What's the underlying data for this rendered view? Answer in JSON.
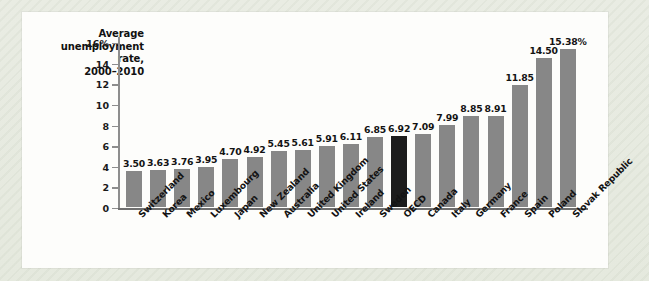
{
  "chart_data": {
    "type": "bar",
    "title": "Average unemployment rate, 2000–2010",
    "title_lines": [
      "Average",
      "unemployment",
      "rate,",
      "2000–2010"
    ],
    "xlabel": "",
    "ylabel": "",
    "ylim": [
      0,
      16
    ],
    "grid": false,
    "legend": null,
    "y_ticks": [
      "0",
      "2",
      "4",
      "6",
      "8",
      "10",
      "12",
      "14",
      "16%"
    ],
    "y_tick_values": [
      0,
      2,
      4,
      6,
      8,
      10,
      12,
      14,
      16
    ],
    "value_suffix_last": "%",
    "highlight_category": "OECD",
    "categories": [
      "Switzerland",
      "Korea",
      "Mexico",
      "Luxembourg",
      "Japan",
      "New Zealand",
      "Australia",
      "United Kingdom",
      "United States",
      "Ireland",
      "Sweden",
      "OECD",
      "Canada",
      "Italy",
      "Germany",
      "France",
      "Spain",
      "Poland",
      "Slovak Republic"
    ],
    "values": [
      3.5,
      3.63,
      3.76,
      3.95,
      4.7,
      4.92,
      5.45,
      5.61,
      5.91,
      6.11,
      6.85,
      6.92,
      7.09,
      7.99,
      8.85,
      8.91,
      11.85,
      14.5,
      15.38
    ],
    "value_labels": [
      "3.50",
      "3.63",
      "3.76",
      "3.95",
      "4.70",
      "4.92",
      "5.45",
      "5.61",
      "5.91",
      "6.11",
      "6.85",
      "6.92",
      "7.09",
      "7.99",
      "8.85",
      "8.91",
      "11.85",
      "14.50",
      "15.38%"
    ]
  },
  "colors": {
    "bar": "#878787",
    "bar_highlight": "#1c1c1c",
    "panel_background": "#fdfdfb",
    "page_background": "#e8ece2",
    "axis": "#8d8d8d",
    "text": "#131313"
  }
}
